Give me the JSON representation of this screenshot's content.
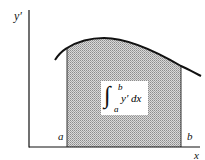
{
  "diagram": {
    "axes": {
      "y_label": "y′",
      "x_label": "x"
    },
    "bounds": {
      "lower": "a",
      "upper": "b"
    },
    "integral": {
      "symbol": "∫",
      "upper_limit": "b",
      "lower_limit": "a",
      "integrand": "y′  dx"
    },
    "colors": {
      "curve": "#111111",
      "shading": "#b8b8b8",
      "background": "#ffffff",
      "label_box": "#ffffff"
    }
  }
}
